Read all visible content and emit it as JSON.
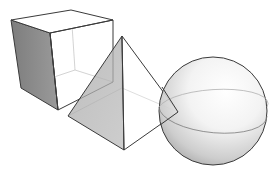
{
  "figure": {
    "description": "Three 3D primitive shapes: cube, square pyramid, sphere",
    "shapes": [
      {
        "name": "cube",
        "label": "Cube"
      },
      {
        "name": "pyramid",
        "label": "Pyramid"
      },
      {
        "name": "sphere",
        "label": "Sphere"
      }
    ],
    "colors": {
      "background": "#ffffff",
      "edge": "#3a3a3a",
      "hidden_edge": "#bdbdbd",
      "shade_dark": "#8e8e8e",
      "shade_mid": "#b5b5b5"
    }
  }
}
